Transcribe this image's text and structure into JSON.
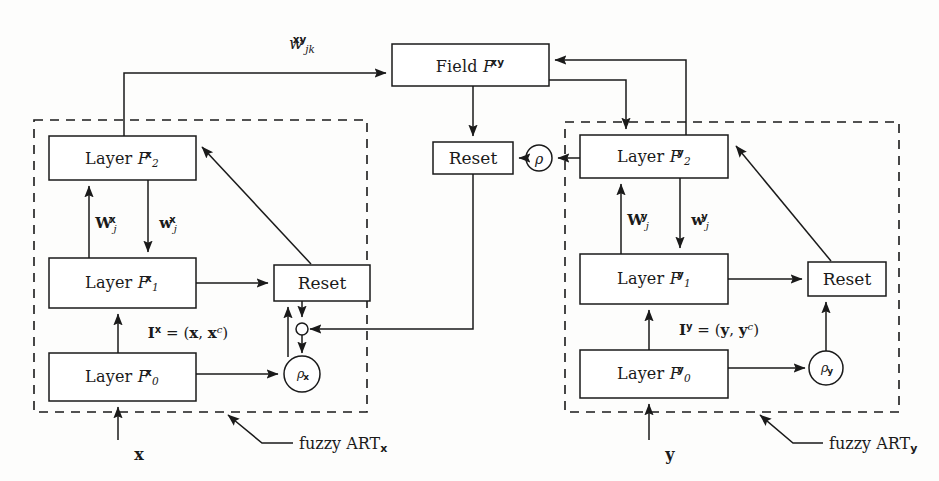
{
  "figure": {
    "type": "block-diagram",
    "background_color": "#fdfdfc",
    "stroke_color": "#1a1a1a"
  },
  "nodes": {
    "field_xy": {
      "label_prefix": "Field ",
      "symbol": "F",
      "sup": "xy",
      "x": 392,
      "y": 44,
      "w": 157,
      "h": 42
    },
    "map_reset": {
      "label": "Reset",
      "x": 433,
      "y": 142,
      "w": 80,
      "h": 32
    },
    "map_rho": {
      "symbol": "ρ",
      "cx": 539,
      "cy": 158,
      "r": 13
    },
    "left_f2": {
      "label_prefix": "Layer ",
      "symbol": "F",
      "sub": "2",
      "sup": "x",
      "x": 49,
      "y": 136,
      "w": 147,
      "h": 44
    },
    "left_f1": {
      "label_prefix": "Layer ",
      "symbol": "F",
      "sub": "1",
      "sup": "x",
      "x": 49,
      "y": 258,
      "w": 147,
      "h": 50
    },
    "left_f0": {
      "label_prefix": "Layer ",
      "symbol": "F",
      "sub": "0",
      "sup": "x",
      "x": 49,
      "y": 353,
      "w": 147,
      "h": 48
    },
    "left_reset": {
      "label": "Reset",
      "x": 274,
      "y": 265,
      "w": 96,
      "h": 36
    },
    "left_rho": {
      "symbol": "ρ",
      "sub": "x",
      "cx": 302,
      "cy": 374,
      "r": 18
    },
    "left_junction": {
      "cx": 302,
      "cy": 329,
      "r": 6
    },
    "right_f2": {
      "label_prefix": "Layer ",
      "symbol": "F",
      "sub": "2",
      "sup": "y",
      "x": 580,
      "y": 135,
      "w": 148,
      "h": 43
    },
    "right_f1": {
      "label_prefix": "Layer ",
      "symbol": "F",
      "sub": "1",
      "sup": "y",
      "x": 580,
      "y": 254,
      "w": 148,
      "h": 50
    },
    "right_f0": {
      "label_prefix": "Layer ",
      "symbol": "F",
      "sub": "0",
      "sup": "y",
      "x": 580,
      "y": 350,
      "w": 148,
      "h": 48
    },
    "right_reset": {
      "label": "Reset",
      "x": 808,
      "y": 262,
      "w": 78,
      "h": 34
    },
    "right_rho": {
      "symbol": "ρ",
      "sub": "y",
      "cx": 826,
      "cy": 368,
      "r": 17
    }
  },
  "modules": {
    "left": {
      "x": 34,
      "y": 120,
      "w": 333,
      "h": 292,
      "caption_prefix": "fuzzy ART",
      "caption_sub": "x",
      "caption_x": 253,
      "caption_y": 447
    },
    "right": {
      "x": 565,
      "y": 122,
      "w": 334,
      "h": 290,
      "caption_prefix": "fuzzy ART",
      "caption_sub": "y",
      "caption_x": 785,
      "caption_y": 447
    }
  },
  "edge_labels": {
    "map_weight": {
      "symbol": "w",
      "sub": "jk",
      "sup": "xy",
      "x": 283,
      "y": 40
    },
    "left_W": {
      "symbol": "W",
      "sub": "j",
      "sup": "x",
      "x": 92,
      "y": 219
    },
    "left_w": {
      "symbol": "w",
      "sub": "j",
      "sup": "x",
      "x": 155,
      "y": 219
    },
    "right_W": {
      "symbol": "W",
      "sub": "j",
      "sup": "y",
      "x": 622,
      "y": 216
    },
    "right_w": {
      "symbol": "w",
      "sub": "j",
      "sup": "y",
      "x": 684,
      "y": 216
    },
    "left_input": {
      "text": "I",
      "sup": "x",
      "eq": " = (",
      "v1": "x",
      "comma": ", ",
      "v2": "x",
      "csup": "c",
      "close": ")",
      "x": 126,
      "y": 333
    },
    "right_input": {
      "text": "I",
      "sup": "y",
      "eq": " = (",
      "v1": "y",
      "comma": ", ",
      "v2": "y",
      "csup": "c",
      "close": ")",
      "x": 656,
      "y": 330
    }
  },
  "inputs": {
    "left_vector": {
      "label": "x",
      "x": 195,
      "y": 448
    },
    "right_vector": {
      "label": "y",
      "x": 724,
      "y": 448
    }
  }
}
